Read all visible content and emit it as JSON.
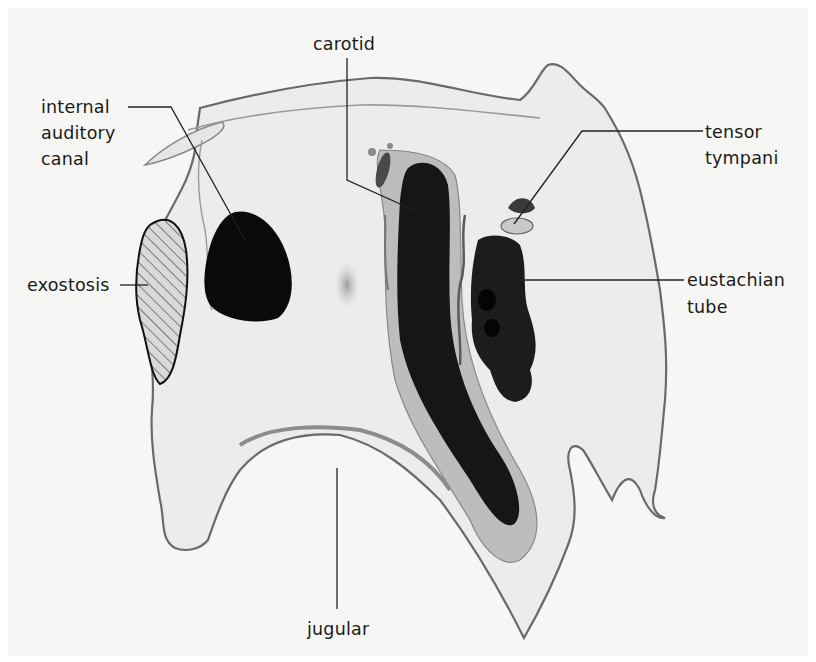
{
  "diagram": {
    "type": "anatomical cross-section",
    "labels": {
      "carotid": "carotid",
      "internal_auditory_canal": [
        "internal",
        "auditory",
        "canal"
      ],
      "tensor_tympani": [
        "tensor",
        "tympani"
      ],
      "exostosis": "exostosis",
      "eustachian_tube": [
        "eustachian",
        "tube"
      ],
      "jugular": "jugular"
    },
    "colors": {
      "background": "#f6f6f4",
      "bone_fill": "#ededeb",
      "outline": "#6e6e6e",
      "dark_structures": "#0d0d0d",
      "leader_lines": "#222222"
    }
  }
}
